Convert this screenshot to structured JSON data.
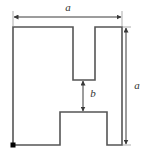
{
  "figure": {
    "type": "engineering-dimension-diagram",
    "colors": {
      "outline": "#555555",
      "dimension_line": "#3a3a3a",
      "label_text": "#333333",
      "origin_marker": "#000000",
      "background": "#ffffff"
    },
    "outline": {
      "stroke_width": 1.6,
      "fill": "none",
      "description": "Square with a narrow rectangular slot cut downward from the top edge and a wider rectangular slot cut upward from the bottom edge",
      "points": "13,27 73,27 73,80 95,80 95,27 122,27 122,145 107,145 107,112 60,112 60,145 13,145 13,27",
      "outer_square": {
        "left": 13,
        "top": 27,
        "right": 122,
        "bottom": 145
      },
      "top_notch": {
        "left": 73,
        "right": 95,
        "top": 27,
        "bottom": 80
      },
      "bottom_notch": {
        "left": 60,
        "right": 107,
        "top": 112,
        "bottom": 145
      }
    },
    "origin_marker": {
      "name": "origin-marker",
      "x": 13,
      "y": 145,
      "size": 5,
      "shape": "filled-square"
    },
    "dimensions": [
      {
        "id": "width-a",
        "label": "a",
        "orientation": "horizontal",
        "line": {
          "x1": 13,
          "y1": 17,
          "x2": 122,
          "y2": 17
        },
        "label_pos": {
          "x": 68,
          "y": 8
        },
        "extension_lines": [
          {
            "x1": 13,
            "y1": 11,
            "x2": 13,
            "y2": 27
          },
          {
            "x1": 122,
            "y1": 11,
            "x2": 122,
            "y2": 27
          }
        ],
        "arrows": "both"
      },
      {
        "id": "height-a",
        "label": "a",
        "orientation": "vertical",
        "line": {
          "x1": 126,
          "y1": 27,
          "x2": 126,
          "y2": 145
        },
        "label_pos": {
          "x": 136,
          "y": 86
        },
        "extension_lines": [
          {
            "x1": 122,
            "y1": 27,
            "x2": 132,
            "y2": 27
          },
          {
            "x1": 122,
            "y1": 145,
            "x2": 132,
            "y2": 145
          }
        ],
        "arrows": "both"
      },
      {
        "id": "gap-b",
        "label": "b",
        "orientation": "vertical",
        "line": {
          "x1": 83,
          "y1": 80,
          "x2": 83,
          "y2": 112
        },
        "label_pos": {
          "x": 93,
          "y": 94
        },
        "extension_lines": [],
        "arrows": "both"
      }
    ]
  }
}
